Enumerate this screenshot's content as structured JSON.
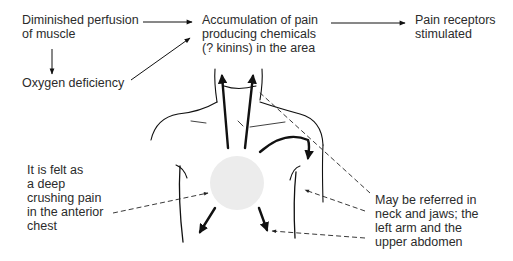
{
  "diagram": {
    "type": "flow-and-anatomical-illustration",
    "nodes": {
      "perfusion": {
        "lines": [
          "Diminished perfusion",
          "of muscle"
        ]
      },
      "oxygen": {
        "lines": [
          "Oxygen deficiency"
        ]
      },
      "accumulation": {
        "lines": [
          "Accumulation of pain",
          "producing chemicals",
          "(? kinins) in the area"
        ]
      },
      "receptors": {
        "lines": [
          "Pain receptors",
          "stimulated"
        ]
      },
      "felt": {
        "lines": [
          "It is felt as",
          "a deep",
          "crushing pain",
          "in the anterior",
          "chest"
        ]
      },
      "referred": {
        "lines": [
          "May be referred in",
          "neck and jaws; the",
          "left arm and the",
          "upper abdomen"
        ]
      }
    },
    "edges": [
      {
        "from": "perfusion",
        "to": "accumulation",
        "style": "solid-arrow"
      },
      {
        "from": "perfusion",
        "to": "oxygen",
        "style": "solid-arrow"
      },
      {
        "from": "oxygen",
        "to": "accumulation",
        "style": "solid-arrow"
      },
      {
        "from": "accumulation",
        "to": "receptors",
        "style": "solid-arrow"
      },
      {
        "from": "felt",
        "to": "chest-pain-area",
        "style": "dashed-arrow"
      },
      {
        "from": "referred",
        "to": "neck-jaw",
        "style": "dashed-line"
      },
      {
        "from": "referred",
        "to": "left-arm",
        "style": "dashed-arrow"
      },
      {
        "from": "referred",
        "to": "upper-abdomen",
        "style": "dashed-arrow"
      }
    ],
    "colors": {
      "text": "#2b2b2b",
      "line": "#111111",
      "pain_area": "#ececec",
      "background": "#ffffff"
    }
  }
}
